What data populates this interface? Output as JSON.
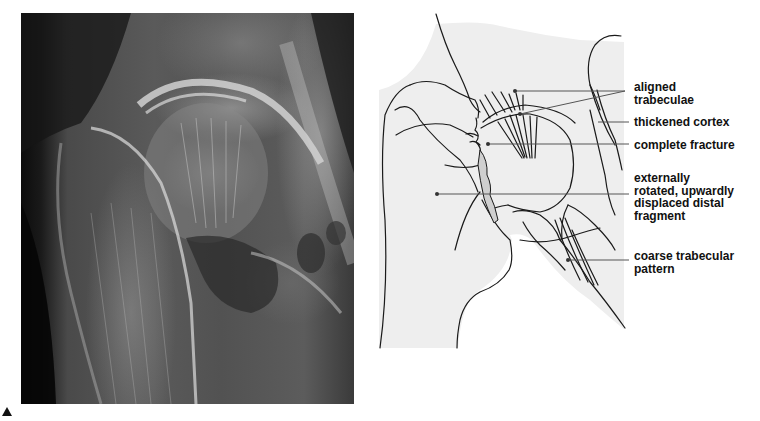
{
  "figure": {
    "left_panel": {
      "type": "radiograph",
      "subject": "hip joint x-ray",
      "marker_icon": "triangle-up-icon"
    },
    "right_panel": {
      "type": "line drawing",
      "background_color": "#eeeeee",
      "fracture_fill_color": "#cfcfcf",
      "line_color": "#1a1a1a",
      "labels": [
        {
          "id": "aligned-trabeculae",
          "text": "aligned\ntrabeculae"
        },
        {
          "id": "thickened-cortex",
          "text": "thickened cortex"
        },
        {
          "id": "complete-fracture",
          "text": "complete fracture"
        },
        {
          "id": "displaced-fragment",
          "text": "externally\nrotated, upwardly\ndisplaced distal\nfragment"
        },
        {
          "id": "coarse-trabecular",
          "text": "coarse trabecular\npattern"
        }
      ]
    }
  }
}
